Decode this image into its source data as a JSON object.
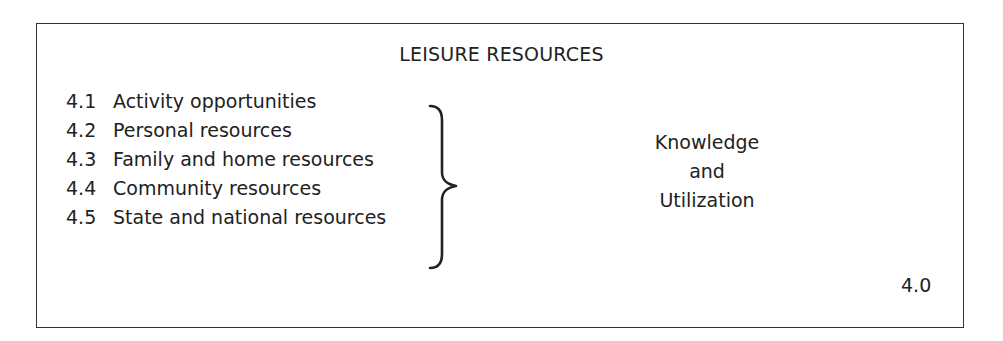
{
  "diagram": {
    "title": "LEISURE RESOURCES",
    "items": [
      {
        "number": "4.1",
        "label": "Activity opportunities"
      },
      {
        "number": "4.2",
        "label": "Personal resources"
      },
      {
        "number": "4.3",
        "label": "Family and home resources"
      },
      {
        "number": "4.4",
        "label": "Community resources"
      },
      {
        "number": "4.5",
        "label": "State and national resources"
      }
    ],
    "grouping_symbol": "right-curly-brace",
    "summary_lines": [
      "Knowledge",
      "and",
      "Utilization"
    ],
    "section_code": "4.0",
    "colors": {
      "text": "#222222",
      "border": "#333333",
      "background": "#ffffff"
    }
  }
}
